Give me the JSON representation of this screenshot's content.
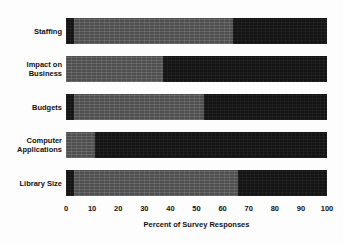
{
  "chart_data": {
    "type": "bar",
    "orientation": "horizontal",
    "stacked": true,
    "title": "",
    "subtitle": "",
    "xlabel": "Percent of Survey Responses",
    "ylabel": "",
    "xlim": [
      0,
      100
    ],
    "xticks": [
      0,
      10,
      20,
      30,
      40,
      50,
      60,
      70,
      80,
      90,
      100
    ],
    "xtick_labels": [
      "0",
      "10",
      "20",
      "30",
      "40",
      "50",
      "60",
      "70",
      "80",
      "90",
      "100"
    ],
    "grid": false,
    "legend": null,
    "legend_position": "none",
    "categories": [
      "Staffing",
      "Impact on Business",
      "Budgets",
      "Computer Applications",
      "Library Size"
    ],
    "category_lines": [
      [
        "Staffing"
      ],
      [
        "Impact on",
        "Business"
      ],
      [
        "Budgets"
      ],
      [
        "Computer",
        "Applications"
      ],
      [
        "Library Size"
      ]
    ],
    "series": [
      {
        "name": "segment-1",
        "color": "#141414",
        "values": [
          3,
          0,
          3,
          0,
          3
        ]
      },
      {
        "name": "segment-2",
        "color": "#585858",
        "values": [
          61,
          37,
          50,
          11,
          63
        ]
      },
      {
        "name": "segment-3",
        "color": "#141414",
        "values": [
          36,
          63,
          47,
          89,
          34
        ]
      }
    ],
    "bars": [
      {
        "category": "Staffing",
        "segments": [
          {
            "shade": "dark",
            "start": 0,
            "end": 3,
            "value": 3
          },
          {
            "shade": "gray",
            "start": 3,
            "end": 64,
            "value": 61
          },
          {
            "shade": "dark",
            "start": 64,
            "end": 100,
            "value": 36
          }
        ]
      },
      {
        "category": "Impact on Business",
        "segments": [
          {
            "shade": "gray",
            "start": 0,
            "end": 37,
            "value": 37
          },
          {
            "shade": "dark",
            "start": 37,
            "end": 100,
            "value": 63
          }
        ]
      },
      {
        "category": "Budgets",
        "segments": [
          {
            "shade": "dark",
            "start": 0,
            "end": 3,
            "value": 3
          },
          {
            "shade": "gray",
            "start": 3,
            "end": 53,
            "value": 50
          },
          {
            "shade": "dark",
            "start": 53,
            "end": 100,
            "value": 47
          }
        ]
      },
      {
        "category": "Computer Applications",
        "segments": [
          {
            "shade": "gray",
            "start": 0,
            "end": 11,
            "value": 11
          },
          {
            "shade": "dark",
            "start": 11,
            "end": 100,
            "value": 89
          }
        ]
      },
      {
        "category": "Library Size",
        "segments": [
          {
            "shade": "dark",
            "start": 0,
            "end": 3,
            "value": 3
          },
          {
            "shade": "gray",
            "start": 3,
            "end": 66,
            "value": 63
          },
          {
            "shade": "dark",
            "start": 66,
            "end": 100,
            "value": 34
          }
        ]
      }
    ],
    "colors": {
      "dark": "#141414",
      "gray": "#585858",
      "background": "#ffffff",
      "text": "#111111"
    }
  }
}
